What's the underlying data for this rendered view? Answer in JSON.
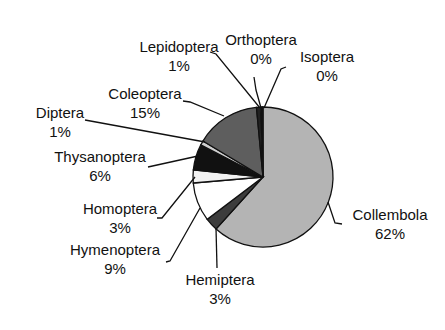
{
  "chart_data": {
    "type": "pie",
    "title": "",
    "start_angle_deg": 0,
    "direction": "clockwise",
    "slices": [
      {
        "label": "Collembola",
        "value": 62,
        "pct_label": "62%",
        "color": "#b4b4b4"
      },
      {
        "label": "Hemiptera",
        "value": 3,
        "pct_label": "3%",
        "color": "#3c3c3c"
      },
      {
        "label": "Hymenoptera",
        "value": 9,
        "pct_label": "9%",
        "color": "#ffffff"
      },
      {
        "label": "Homoptera",
        "value": 3,
        "pct_label": "3%",
        "color": "#f2f2f2"
      },
      {
        "label": "Thysanoptera",
        "value": 6,
        "pct_label": "6%",
        "color": "#111111"
      },
      {
        "label": "Diptera",
        "value": 1,
        "pct_label": "1%",
        "color": "#cfcfcf"
      },
      {
        "label": "Coleoptera",
        "value": 15,
        "pct_label": "15%",
        "color": "#5e5e5e"
      },
      {
        "label": "Lepidoptera",
        "value": 1,
        "pct_label": "1%",
        "color": "#222222"
      },
      {
        "label": "Orthoptera",
        "value": 0.3,
        "pct_label": "0%",
        "color": "#dddddd"
      },
      {
        "label": "Isoptera",
        "value": 0.2,
        "pct_label": "0%",
        "color": "#888888"
      }
    ],
    "legend": "none (leader-line labels)"
  },
  "labels": {
    "lepidoptera": {
      "name": "Lepidoptera",
      "pct": "1%"
    },
    "orthoptera": {
      "name": "Orthoptera",
      "pct": "0%"
    },
    "isoptera": {
      "name": "Isoptera",
      "pct": "0%"
    },
    "coleoptera": {
      "name": "Coleoptera",
      "pct": "15%"
    },
    "diptera": {
      "name": "Diptera",
      "pct": "1%"
    },
    "thysanoptera": {
      "name": "Thysanoptera",
      "pct": "6%"
    },
    "homoptera": {
      "name": "Homoptera",
      "pct": "3%"
    },
    "hymenoptera": {
      "name": "Hymenoptera",
      "pct": "9%"
    },
    "hemiptera": {
      "name": "Hemiptera",
      "pct": "3%"
    },
    "collembola": {
      "name": "Collembola",
      "pct": "62%"
    }
  }
}
